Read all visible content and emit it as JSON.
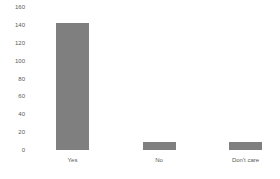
{
  "chart_data": {
    "type": "bar",
    "title": "",
    "xlabel": "",
    "ylabel": "",
    "categories": [
      "Yes",
      "No",
      "Don't care"
    ],
    "values": [
      143,
      9,
      9
    ],
    "ylim": [
      0,
      160
    ],
    "yticks": [
      0,
      20,
      40,
      60,
      80,
      100,
      120,
      140,
      160
    ],
    "grid": false,
    "legend": "none",
    "bar_color": "#7f7f7f",
    "axis_label_color": "#595959",
    "background_color": "#ffffff"
  }
}
